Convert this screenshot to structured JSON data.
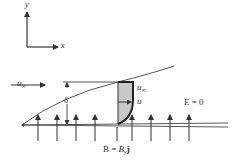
{
  "axes": {
    "y_label": "y",
    "x_label": "x"
  },
  "freestream": {
    "label_main": "u",
    "label_sub": "∞"
  },
  "boundary_layer": {
    "thickness_label": "δ",
    "edge_velocity_main": "u",
    "edge_velocity_sub": "∞",
    "local_velocity_label": "u"
  },
  "fields": {
    "electric_field": "E = 0",
    "magnetic_field_prefix": "B = ",
    "magnetic_field_main": "B",
    "magnetic_field_sub": "y",
    "magnetic_field_unit": "j"
  },
  "colors": {
    "ink": "#333333",
    "profile_fill": "#c8c8c8"
  },
  "field_arrow_x": [
    38,
    57,
    76,
    95,
    117,
    132,
    151,
    170,
    189
  ]
}
